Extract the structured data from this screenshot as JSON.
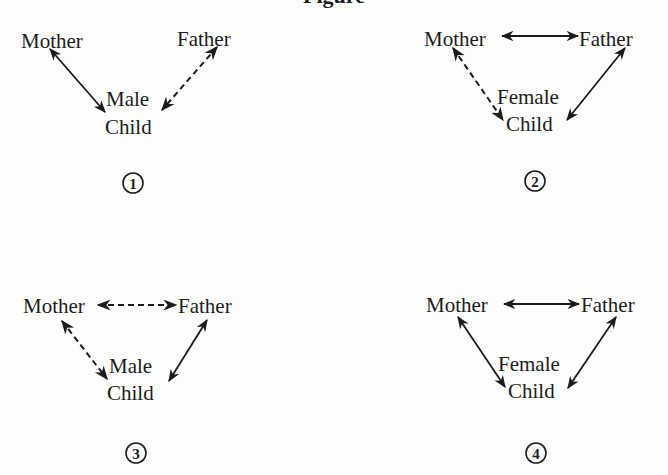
{
  "figure": {
    "title": "Figure",
    "colors": {
      "ink": "#1c1c1c",
      "paper": "#fdfdfc"
    }
  },
  "panels": [
    {
      "number": "1",
      "mother": "Mother",
      "father": "Father",
      "child_gender": "Male",
      "child": "Child",
      "relations": {
        "mother_father": "none",
        "mother_child": "solid",
        "father_child": "dashed"
      }
    },
    {
      "number": "2",
      "mother": "Mother",
      "father": "Father",
      "child_gender": "Female",
      "child": "Child",
      "relations": {
        "mother_father": "solid",
        "mother_child": "dashed",
        "father_child": "solid"
      }
    },
    {
      "number": "3",
      "mother": "Mother",
      "father": "Father",
      "child_gender": "Male",
      "child": "Child",
      "relations": {
        "mother_father": "dashed",
        "mother_child": "dashed",
        "father_child": "solid"
      }
    },
    {
      "number": "4",
      "mother": "Mother",
      "father": "Father",
      "child_gender": "Female",
      "child": "Child",
      "relations": {
        "mother_father": "solid",
        "mother_child": "solid",
        "father_child": "solid"
      }
    }
  ],
  "legend_note": {
    "solid": "solid double-headed arrow",
    "dashed": "dashed double-headed arrow",
    "none": "no connection"
  }
}
